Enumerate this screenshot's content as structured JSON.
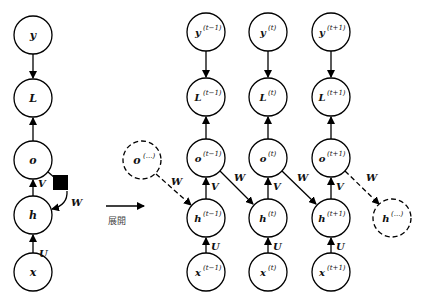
{
  "diagram": {
    "type": "rnn-unfolding",
    "unfold_label": "展開",
    "folded": {
      "nodes": [
        {
          "id": "y",
          "label": "y"
        },
        {
          "id": "L",
          "label": "L"
        },
        {
          "id": "o",
          "label": "o"
        },
        {
          "id": "h",
          "label": "h"
        },
        {
          "id": "x",
          "label": "x"
        }
      ],
      "edges": {
        "U": "U",
        "V": "V",
        "W": "W"
      }
    },
    "unfolded": {
      "columns": [
        {
          "y": "y",
          "y_sup": "(t−1)",
          "L": "L",
          "L_sup": "(t−1)",
          "o": "o",
          "o_sup": "(t−1)",
          "h": "h",
          "h_sup": "(t−1)",
          "x": "x",
          "x_sup": "(t−1)"
        },
        {
          "y": "y",
          "y_sup": "(t)",
          "L": "L",
          "L_sup": "(t)",
          "o": "o",
          "o_sup": "(t)",
          "h": "h",
          "h_sup": "(t)",
          "x": "x",
          "x_sup": "(t)"
        },
        {
          "y": "y",
          "y_sup": "(t+1)",
          "L": "L",
          "L_sup": "(t+1)",
          "o": "o",
          "o_sup": "(t+1)",
          "h": "h",
          "h_sup": "(t+1)",
          "x": "x",
          "x_sup": "(t+1)"
        }
      ],
      "dashed_start": {
        "label": "o",
        "sup": "(...)"
      },
      "dashed_end": {
        "label": "h",
        "sup": "(...)"
      },
      "edge_labels": {
        "U": "U",
        "V": "V",
        "W": "W"
      }
    }
  }
}
